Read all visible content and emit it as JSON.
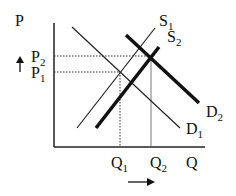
{
  "diagram": {
    "axis_labels": {
      "y": "P",
      "x": "Q"
    },
    "price_labels": [
      {
        "base": "P",
        "sub": "2"
      },
      {
        "base": "P",
        "sub": "1"
      }
    ],
    "quantity_labels": [
      {
        "base": "Q",
        "sub": "1"
      },
      {
        "base": "Q",
        "sub": "2"
      }
    ],
    "curves": [
      {
        "base": "S",
        "sub": "1",
        "weight": "thin"
      },
      {
        "base": "S",
        "sub": "2",
        "weight": "thick"
      },
      {
        "base": "D",
        "sub": "1",
        "weight": "thin"
      },
      {
        "base": "D",
        "sub": "2",
        "weight": "thick"
      }
    ],
    "arrows": {
      "price": "up",
      "quantity": "right"
    },
    "colors": {
      "line": "#111111",
      "background": "#ffffff"
    }
  }
}
